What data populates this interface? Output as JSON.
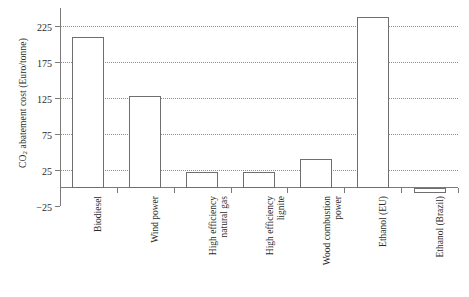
{
  "chart_data": {
    "type": "bar",
    "title": "",
    "xlabel": "",
    "ylabel": "CO2 abatement cost (Euro/tonne)",
    "ylabel_prefix": "CO",
    "ylabel_sub": "2",
    "ylabel_suffix": " abatement cost (Euro/tonne)",
    "categories": [
      "Biodiesel",
      "Wind power",
      "High efficiency natural gas",
      "High efficiency lignite",
      "Wood combustion power",
      "Ethanol (EU)",
      "Ethanol (Brazil)"
    ],
    "category_lines": [
      [
        "Biodiesel"
      ],
      [
        "Wind power"
      ],
      [
        "High efficiency",
        "natural gas"
      ],
      [
        "High efficiency",
        "lignite"
      ],
      [
        "Wood combustion",
        "power"
      ],
      [
        "Ethanol (EU)"
      ],
      [
        "Ethanol (Brazil)"
      ]
    ],
    "values": [
      210,
      128,
      22,
      22,
      40,
      237,
      -7
    ],
    "ylim": [
      -25,
      250
    ],
    "yticks": [
      225,
      175,
      125,
      75,
      25,
      -25
    ],
    "ytick_labels": [
      "225",
      "175",
      "125",
      "75",
      "25",
      "−25"
    ],
    "grid": true,
    "grid_values": [
      225,
      175,
      125,
      75,
      25
    ],
    "legend": "none",
    "bar_fill": "#ffffff",
    "bar_edge": "#6f6f6f",
    "axis_color": "#7a7a7a",
    "grid_color": "#8d8d8d"
  }
}
